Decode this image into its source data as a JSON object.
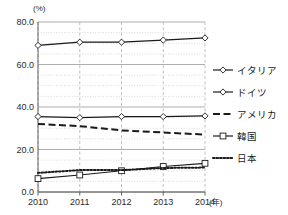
{
  "chart_data": {
    "type": "line",
    "title": "",
    "subtitle": "",
    "xlabel": "(年)",
    "ylabel": "(%)",
    "categories": [
      "2010",
      "2011",
      "2012",
      "2013",
      "2014"
    ],
    "x": [
      2010,
      2011,
      2012,
      2013,
      2014
    ],
    "xlim": [
      2010,
      2014
    ],
    "ylim": [
      0.0,
      80.0
    ],
    "yticks": [
      "0.0",
      "20.0",
      "40.0",
      "60.0",
      "80.0"
    ],
    "ytick_values": [
      0.0,
      20.0,
      40.0,
      60.0,
      80.0
    ],
    "minor_tick_step": 5,
    "grid": "major-solid-horizontal, minor-dotted-horizontal, dashed-vertical",
    "legend_position": "right",
    "series": [
      {
        "name": "イタリア",
        "marker": "diamond-open",
        "line": "solid",
        "values": [
          69.0,
          70.5,
          70.5,
          71.5,
          72.5
        ]
      },
      {
        "name": "ドイツ",
        "marker": "diamond-open",
        "line": "solid",
        "values": [
          35.5,
          35.0,
          35.5,
          35.5,
          35.8
        ]
      },
      {
        "name": "アメリカ",
        "marker": "none",
        "line": "dashed",
        "values": [
          32.0,
          31.0,
          29.0,
          28.0,
          27.0
        ]
      },
      {
        "name": "韓国",
        "marker": "square-open",
        "line": "solid",
        "values": [
          6.3,
          8.0,
          10.0,
          12.0,
          13.5
        ]
      },
      {
        "name": "日本",
        "marker": "none",
        "line": "dotted",
        "values": [
          9.0,
          10.3,
          10.3,
          11.3,
          11.5
        ]
      }
    ]
  },
  "legend": {
    "items": [
      {
        "label": "イタリア",
        "marker": "diamond-open",
        "line": "solid"
      },
      {
        "label": "ドイツ",
        "marker": "diamond-open",
        "line": "solid"
      },
      {
        "label": "アメリカ",
        "marker": "none",
        "line": "dashed"
      },
      {
        "label": "韓国",
        "marker": "square-open",
        "line": "solid"
      },
      {
        "label": "日本",
        "marker": "none",
        "line": "dotted"
      }
    ]
  },
  "colors": {
    "line": "#1a1a1a",
    "major_grid": "#9a9a9a",
    "minor_grid": "#c9c9c9",
    "vertical_grid": "#b0b0b0",
    "axis": "#555555",
    "background": "#ffffff",
    "marker_fill": "#ffffff"
  }
}
